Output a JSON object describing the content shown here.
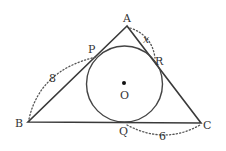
{
  "diagram": {
    "colors": {
      "stroke": "#3a3a3a",
      "text": "#333333",
      "background": "#ffffff"
    },
    "vertices": {
      "A": {
        "label": "A",
        "x": 127,
        "y": 26
      },
      "B": {
        "label": "B",
        "x": 28,
        "y": 122
      },
      "C": {
        "label": "C",
        "x": 201,
        "y": 123
      }
    },
    "tangent_points": {
      "P": {
        "label": "P",
        "x": 96,
        "y": 57
      },
      "Q": {
        "label": "Q",
        "x": 125,
        "y": 122
      },
      "R": {
        "label": "R",
        "x": 153,
        "y": 58
      }
    },
    "incircle": {
      "center_label": "O",
      "cx": 124.5,
      "cy": 84,
      "r": 38
    },
    "measurements": [
      {
        "segment": "BP",
        "label": "8"
      },
      {
        "segment": "QC",
        "label": "6"
      },
      {
        "segment": "AR",
        "label": "x"
      }
    ]
  }
}
